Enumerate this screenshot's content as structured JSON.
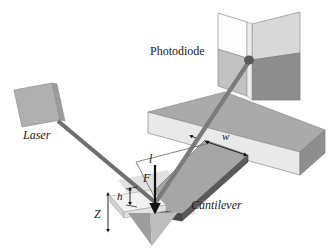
{
  "figure": {
    "kind": "afm-optical-lever-diagram",
    "background_color": "#ffffff",
    "width": 336,
    "height": 251
  },
  "labels": {
    "photodiode": "Photodiode",
    "laser": "Laser",
    "cantilever": "Cantilever",
    "length": "l",
    "width": "w",
    "force": "F",
    "tip_height": "h",
    "z_displacement": "Z"
  },
  "components": {
    "laser_source": {
      "name": "Laser",
      "face_color": "#b0b0b0",
      "edge_color": "#8f8f8f"
    },
    "photodiode": {
      "name": "Photodiode",
      "type": "quadrant-detector",
      "quadrants": [
        {
          "position": "top-left",
          "color": "#fdfdfd"
        },
        {
          "position": "top-right",
          "color": "#d8d8d8"
        },
        {
          "position": "bottom-left",
          "color": "#c2c2c2"
        },
        {
          "position": "bottom-right",
          "color": "#8d8d8d"
        }
      ],
      "divider_color": "#e6e6e6",
      "outline_color": "#7a7a7a"
    },
    "substrate_block": {
      "top_color": "#aaaaaa",
      "front_color": "#e9e9e9",
      "end_color": "#8e8e8e",
      "outline_color": "#8a8a8a"
    },
    "cantilever": {
      "top_color": "#a6a6a6",
      "edge_color": "#4a4a4a",
      "outline_color": "#6f6f6f"
    },
    "tip": {
      "shape": "pyramid",
      "left_color": "#9d9d9d",
      "right_color": "#bdbdbd",
      "shadow_color": "#d6d6d6"
    },
    "laser_beam": {
      "incident_color": "#6e6e6e",
      "reflected_color": "#7b7b7b",
      "spot_color": "#5a5a5a"
    }
  },
  "annotations": {
    "force_arrow": {
      "label": "F",
      "color": "#111111",
      "direction": "down"
    },
    "length_leader": {
      "label": "l",
      "color": "#555555"
    },
    "width_arrow": {
      "label": "w",
      "color": "#111111",
      "direction": "double"
    },
    "height_arrow": {
      "label": "h",
      "color": "#111111",
      "direction": "double"
    },
    "z_arrow": {
      "label": "Z",
      "color": "#111111",
      "direction": "double"
    }
  }
}
